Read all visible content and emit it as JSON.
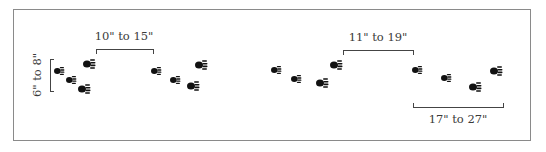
{
  "diagram": {
    "type": "animal-track-pattern",
    "labels": {
      "group_width": "6\" to 8\"",
      "gap_left": "10\" to 15\"",
      "gap_right": "11\" to 19\"",
      "stride": "17\" to 27\""
    },
    "colors": {
      "frame": "#8a8a8a",
      "bracket": "#444444",
      "print": "#111111",
      "text": "#3a3a3a"
    },
    "track_groups": [
      {
        "name": "group-1",
        "prints": [
          {
            "x": 59,
            "y": 71,
            "size": "small"
          },
          {
            "x": 71,
            "y": 80,
            "size": "small"
          },
          {
            "x": 84,
            "y": 89,
            "size": "big"
          },
          {
            "x": 89,
            "y": 64,
            "size": "big"
          }
        ]
      },
      {
        "name": "group-2",
        "prints": [
          {
            "x": 156,
            "y": 71,
            "size": "small"
          },
          {
            "x": 175,
            "y": 80,
            "size": "small"
          },
          {
            "x": 193,
            "y": 86,
            "size": "big"
          },
          {
            "x": 201,
            "y": 65,
            "size": "big"
          }
        ]
      },
      {
        "name": "group-3",
        "prints": [
          {
            "x": 276,
            "y": 70,
            "size": "small"
          },
          {
            "x": 296,
            "y": 79,
            "size": "small"
          },
          {
            "x": 322,
            "y": 83,
            "size": "big"
          },
          {
            "x": 336,
            "y": 65,
            "size": "big"
          }
        ]
      },
      {
        "name": "group-4",
        "prints": [
          {
            "x": 417,
            "y": 70,
            "size": "small"
          },
          {
            "x": 446,
            "y": 78,
            "size": "small"
          },
          {
            "x": 475,
            "y": 87,
            "size": "big"
          },
          {
            "x": 496,
            "y": 71,
            "size": "big"
          }
        ]
      }
    ]
  }
}
